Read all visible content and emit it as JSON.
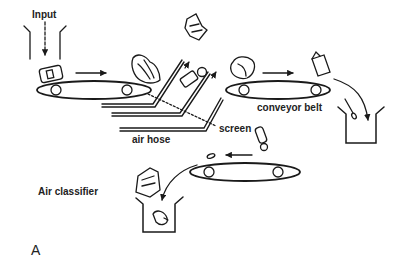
{
  "figure": {
    "panel_label": "A",
    "labels": {
      "input": "Input",
      "conveyor_belt": "conveyor belt",
      "screen": "screen",
      "air_hose": "air hose",
      "air_classifier": "Air classifier"
    },
    "components": [
      {
        "name": "input-hopper",
        "description": "Input chute with downward dashed arrow"
      },
      {
        "name": "conveyor-belt-1",
        "rollers": 2
      },
      {
        "name": "air-hoses",
        "count": 3
      },
      {
        "name": "screen",
        "style": "dotted line"
      },
      {
        "name": "conveyor-belt-2",
        "rollers": 2
      },
      {
        "name": "collection-bin-right"
      },
      {
        "name": "conveyor-belt-3",
        "rollers": 2
      },
      {
        "name": "collection-bin-bottom"
      }
    ],
    "colors": {
      "stroke": "#1a1a1a",
      "background": "#ffffff"
    }
  }
}
